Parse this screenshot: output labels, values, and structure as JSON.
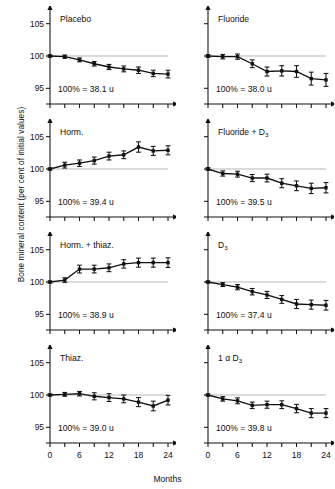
{
  "figure": {
    "y_axis_caption": "Bone mineral content (per cent of initial values)",
    "x_axis_caption": "Months"
  },
  "chart_data": {
    "type": "line",
    "title": "",
    "xlabel": "Months",
    "ylabel": "Bone mineral content (per cent of initial values)",
    "xlim": [
      0,
      24
    ],
    "ylim": [
      93.5,
      106.5
    ],
    "xticks": [
      0,
      3,
      6,
      9,
      12,
      15,
      18,
      21,
      24
    ],
    "xticklabels": [
      "0",
      "",
      "6",
      "",
      "12",
      "",
      "18",
      "",
      "24"
    ],
    "yticks": [
      95,
      100,
      105
    ],
    "yticklabels": [
      "95",
      "100",
      "105"
    ],
    "grid": false,
    "reference_line": 100,
    "legend": "none",
    "error_bars": "standard error",
    "x": [
      0,
      3,
      6,
      9,
      12,
      15,
      18,
      21,
      24
    ],
    "panels": [
      {
        "name": "placebo",
        "title": "Placebo",
        "baseline_label": "100% = 38.1 u",
        "values": [
          100.0,
          99.9,
          99.4,
          98.8,
          98.3,
          98.0,
          97.8,
          97.3,
          97.2
        ],
        "errors": [
          0.15,
          0.25,
          0.3,
          0.35,
          0.4,
          0.45,
          0.5,
          0.5,
          0.6
        ]
      },
      {
        "name": "fluoride",
        "title": "Fluoride",
        "baseline_label": "100% = 38.0 u",
        "values": [
          100.0,
          99.9,
          99.9,
          98.8,
          97.6,
          97.7,
          97.6,
          96.5,
          96.3
        ],
        "errors": [
          0.2,
          0.35,
          0.4,
          0.6,
          0.7,
          0.8,
          0.9,
          1.0,
          1.0
        ]
      },
      {
        "name": "horm",
        "title": "Horm.",
        "baseline_label": "100% = 39.4 u",
        "values": [
          100.0,
          100.6,
          100.9,
          101.3,
          102.0,
          102.2,
          103.4,
          102.8,
          102.9
        ],
        "errors": [
          0.15,
          0.45,
          0.5,
          0.55,
          0.6,
          0.6,
          0.8,
          0.7,
          0.7
        ]
      },
      {
        "name": "fluoride-d3",
        "title": "Fluoride + D",
        "title_sub": "3",
        "baseline_label": "100% = 39.5 u",
        "values": [
          100.0,
          99.3,
          99.2,
          98.6,
          98.6,
          97.8,
          97.4,
          97.0,
          97.1
        ],
        "errors": [
          0.2,
          0.4,
          0.45,
          0.55,
          0.6,
          0.7,
          0.75,
          0.8,
          0.8
        ]
      },
      {
        "name": "horm-thiaz",
        "title": "Horm. + thiaz.",
        "baseline_label": "100% = 38.9 u",
        "values": [
          100.0,
          100.3,
          102.0,
          102.0,
          102.2,
          102.8,
          103.0,
          103.0,
          103.0
        ],
        "errors": [
          0.15,
          0.35,
          0.6,
          0.6,
          0.6,
          0.65,
          0.7,
          0.7,
          0.75
        ]
      },
      {
        "name": "d3",
        "title": "D",
        "title_sub": "3",
        "baseline_label": "100% = 37.4 u",
        "values": [
          100.0,
          99.6,
          99.2,
          98.5,
          98.0,
          97.3,
          96.6,
          96.5,
          96.4
        ],
        "errors": [
          0.15,
          0.3,
          0.4,
          0.5,
          0.55,
          0.6,
          0.7,
          0.7,
          0.75
        ]
      },
      {
        "name": "thiaz",
        "title": "Thiaz.",
        "baseline_label": "100% = 39.0 u",
        "values": [
          100.0,
          100.1,
          100.2,
          99.8,
          99.6,
          99.4,
          98.9,
          98.3,
          99.2
        ],
        "errors": [
          0.15,
          0.3,
          0.35,
          0.55,
          0.6,
          0.6,
          0.7,
          0.75,
          0.75
        ]
      },
      {
        "name": "one-alpha-d3",
        "title": "1 α D",
        "title_sub": "3",
        "baseline_label": "100% = 39.8 u",
        "values": [
          100.0,
          99.4,
          99.1,
          98.4,
          98.5,
          98.5,
          97.9,
          97.2,
          97.2
        ],
        "errors": [
          0.15,
          0.35,
          0.45,
          0.5,
          0.55,
          0.6,
          0.65,
          0.7,
          0.7
        ]
      }
    ]
  }
}
